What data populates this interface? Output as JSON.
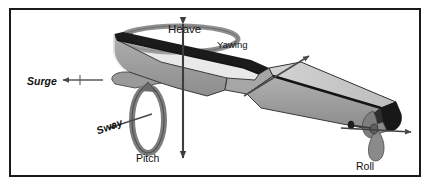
{
  "figure": {
    "frame_color": "#1a1a1a",
    "background_color": "#ffffff"
  },
  "labels": {
    "heave": "Heave",
    "yawing": "Yawing",
    "surge": "Surge",
    "sway": "Sway",
    "pitch": "Pitch",
    "roll": "Roll"
  },
  "colors": {
    "hull_side": "#9c9c9c",
    "deck_top": "#c9c9c9",
    "deck_interior": "#1b1b1b",
    "outline": "#111111",
    "arrow": "#4a4a4a",
    "ring": "#8a8a8a",
    "propeller": "#7a7a7a"
  },
  "motions": [
    {
      "name": "Heave",
      "type": "translation",
      "axis": "vertical",
      "label": "Heave"
    },
    {
      "name": "Surge",
      "type": "translation",
      "axis": "longitudinal",
      "label": "Surge"
    },
    {
      "name": "Sway",
      "type": "translation",
      "axis": "transverse",
      "label": "Sway"
    },
    {
      "name": "Yawing",
      "type": "rotation",
      "axis": "vertical",
      "label": "Yawing"
    },
    {
      "name": "Pitch",
      "type": "rotation",
      "axis": "transverse",
      "label": "Pitch"
    },
    {
      "name": "Roll",
      "type": "rotation",
      "axis": "longitudinal",
      "label": "Roll"
    }
  ]
}
